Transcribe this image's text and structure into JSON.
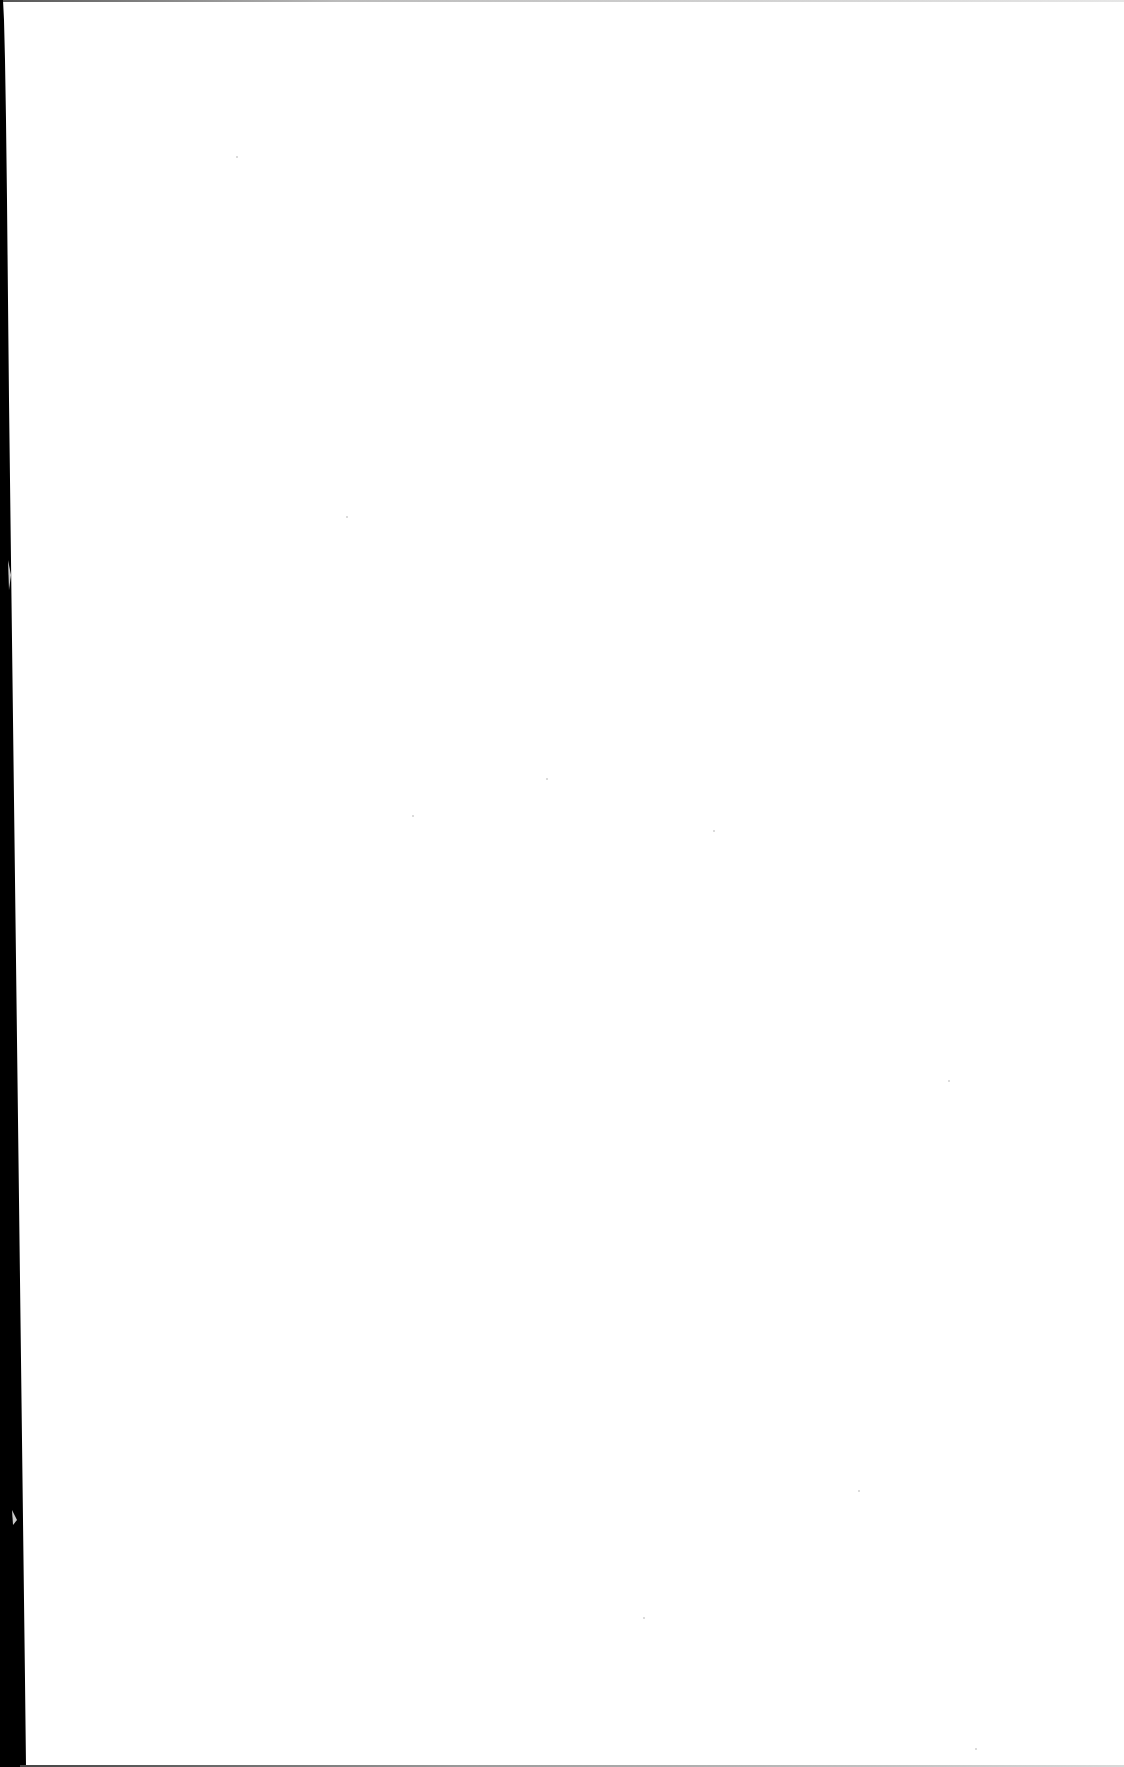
{
  "document": {
    "type": "scanned-page",
    "content": "",
    "is_blank": true,
    "colors": {
      "paper": "#ffffff",
      "scan_edge": "#000000",
      "border": "#9a9a9a"
    }
  }
}
